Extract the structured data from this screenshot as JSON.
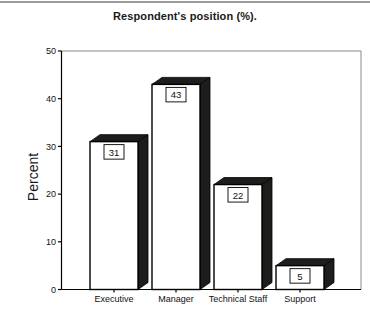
{
  "page": {
    "title": "Respondent's position (%)."
  },
  "chart_data": {
    "type": "bar",
    "title": "Respondent's position (%).",
    "xlabel": "",
    "ylabel": "Percent",
    "categories": [
      "Executive",
      "Manager",
      "Technical Staff",
      "Support"
    ],
    "values": [
      31,
      43,
      22,
      5
    ],
    "value_labels": [
      "31",
      "43",
      "22",
      "5"
    ],
    "ylim": [
      0,
      50
    ],
    "yticks": [
      0,
      10,
      20,
      30,
      40,
      50
    ],
    "grid": false,
    "legend": "none",
    "style": {
      "bar_fill": "#ffffff",
      "bar_outline": "#000000",
      "shadow_3d_color": "#1d1d1b",
      "axis_color": "#000000",
      "frame_light_color": "#8a8a8a",
      "page_rule_color": "#9c9c9c",
      "text_color": "#111111"
    }
  }
}
